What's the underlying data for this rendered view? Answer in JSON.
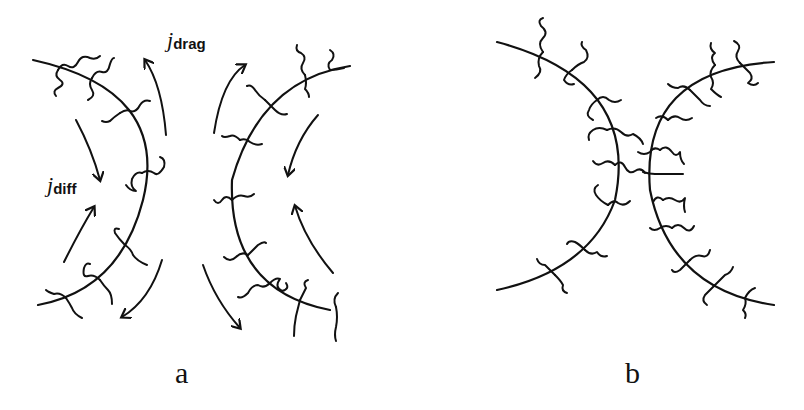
{
  "figure": {
    "panels": [
      {
        "id": "a",
        "label": "a",
        "description": "Two polymer-brush-coated surfaces (curved arcs) facing each other with grafted chains and flow arrows",
        "annotations": {
          "drag_flux": {
            "symbol": "j",
            "subscript": "drag"
          },
          "diffusive_flux": {
            "symbol": "j",
            "subscript": "diff"
          }
        }
      },
      {
        "id": "b",
        "label": "b",
        "description": "Two brush-coated surfaces crossing/overlapping with interpenetrating polymer chains"
      }
    ],
    "colors": {
      "ink": "#111111",
      "background": "#ffffff"
    }
  }
}
